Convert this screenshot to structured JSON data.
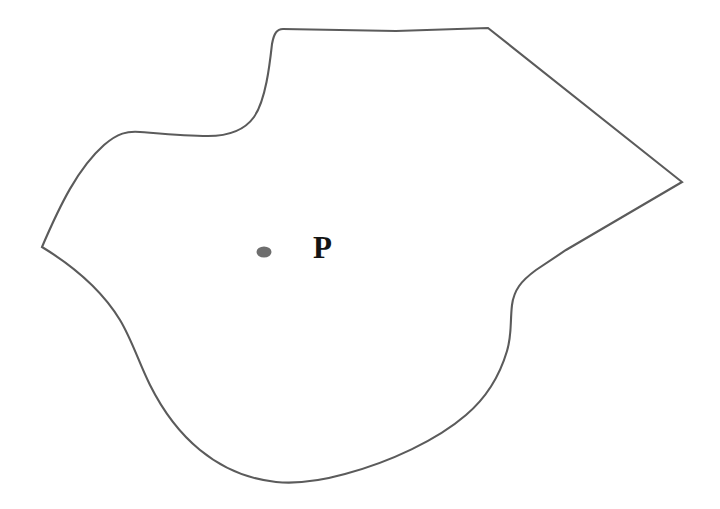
{
  "figure": {
    "background_color": "#ffffff",
    "canvas": {
      "width": 720,
      "height": 509
    },
    "region": {
      "name": "closed-plane-region",
      "stroke_color": "#5b5b5b",
      "fill_color": "#ffffff",
      "stroke_width": 2.1,
      "path": "M 42 247 C 60 205 78 168 104 145 C 118 133 127 131 140 132 C 165 134 186 136 208 136 C 228 136 244 131 254 117 C 266 100 270 62 272 44 C 274 33 277 29 283 29 L 396 31 L 488 28 L 682 182 L 566 250 L 536 270 C 521 281 514 290 512 305 C 510 322 512 335 507 351 C 499 378 486 398 466 415 C 437 440 390 462 345 474 C 316 482 296 484 276 482 C 248 479 222 468 200 450 C 178 432 162 409 150 385 C 139 363 132 340 120 320 C 106 297 83 272 42 247 Z"
    },
    "point": {
      "name": "P",
      "label": "P",
      "marker_color": "#6e6e6e",
      "marker_shape": "ellipse",
      "marker_center": {
        "x": 264,
        "y": 252
      },
      "marker_radius": {
        "rx": 7.5,
        "ry": 5.5
      },
      "label_color": "#141414",
      "label_position": {
        "x": 313,
        "y": 258
      }
    }
  }
}
